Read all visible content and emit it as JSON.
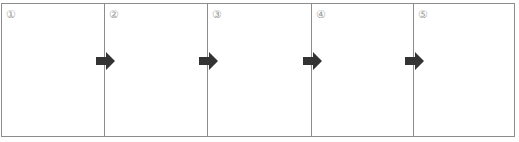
{
  "diagram": {
    "type": "sequence-panels",
    "panels": [
      {
        "label": "①"
      },
      {
        "label": "②"
      },
      {
        "label": "③"
      },
      {
        "label": "④"
      },
      {
        "label": "⑤"
      }
    ],
    "arrows": [
      {
        "from": "①",
        "to": "②",
        "icon": "right-arrow-icon"
      },
      {
        "from": "②",
        "to": "③",
        "icon": "right-arrow-icon"
      },
      {
        "from": "③",
        "to": "④",
        "icon": "right-arrow-icon"
      },
      {
        "from": "④",
        "to": "⑤",
        "icon": "right-arrow-icon"
      }
    ],
    "colors": {
      "border": "#8c8c8c",
      "arrow": "#333333",
      "label": "#9a9a9a"
    }
  }
}
